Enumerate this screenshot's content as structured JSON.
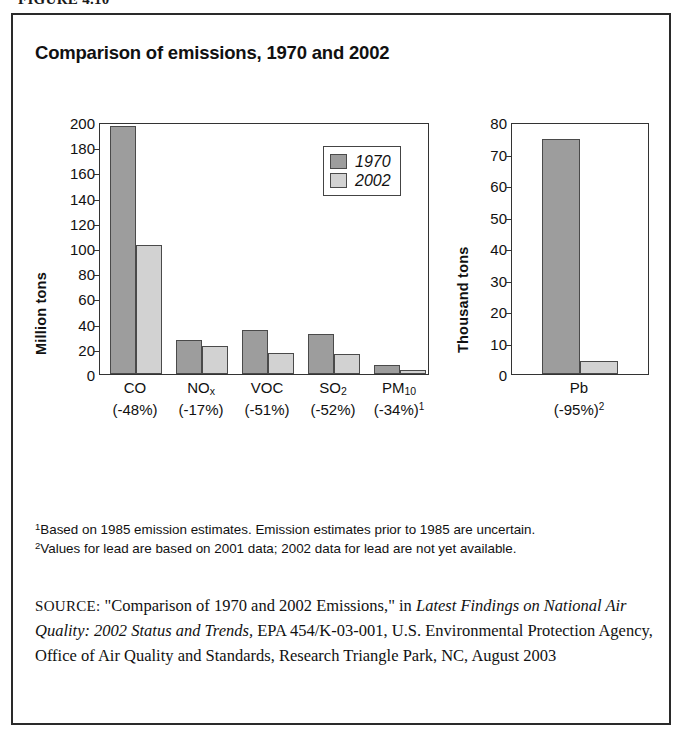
{
  "figure": {
    "number_label": "FIGURE 4.10"
  },
  "chart": {
    "title": "Comparison of emissions, 1970 and 2002"
  },
  "legend": {
    "items": [
      {
        "label": "1970",
        "color": "#9d9d9d",
        "swatch_name": "legend-swatch-1970"
      },
      {
        "label": "2002",
        "color": "#d2d2d2",
        "swatch_name": "legend-swatch-2002"
      }
    ]
  },
  "left_panel": {
    "ylabel": "Million tons",
    "ticks": [
      "0",
      "20",
      "40",
      "60",
      "80",
      "100",
      "120",
      "140",
      "160",
      "180",
      "200"
    ]
  },
  "right_panel": {
    "ylabel": "Thousand tons",
    "ticks": [
      "0",
      "10",
      "20",
      "30",
      "40",
      "50",
      "60",
      "70",
      "80"
    ]
  },
  "categories_left": [
    {
      "name": "CO",
      "sub": "",
      "pct": "(-48%)",
      "note": ""
    },
    {
      "name": "NO",
      "sub": "x",
      "pct": "(-17%)",
      "note": ""
    },
    {
      "name": "VOC",
      "sub": "",
      "pct": "(-51%)",
      "note": ""
    },
    {
      "name": "SO",
      "sub": "2",
      "pct": "(-52%)",
      "note": ""
    },
    {
      "name": "PM",
      "sub": "10",
      "pct": "(-34%)",
      "note": "1"
    }
  ],
  "categories_right": [
    {
      "name": "Pb",
      "sub": "",
      "pct": "(-95%)",
      "note": "2"
    }
  ],
  "footnotes": [
    {
      "marker": "1",
      "text": "Based on 1985 emission estimates. Emission estimates prior to 1985 are uncertain."
    },
    {
      "marker": "2",
      "text": "Values for lead are based on 2001 data; 2002 data for lead are not yet available."
    }
  ],
  "source": {
    "label": "SOURCE:",
    "part1": " \"Comparison of 1970 and 2002 Emissions,\" in ",
    "italic1": "Latest Findings on National Air Quality: 2002 Status and Trends,",
    "part2": " EPA 454/K-03-001, U.S. Environmental Protection Agency, Office of Air Quality and Standards, Research Triangle Park, NC, August 2003"
  },
  "chart_data": [
    {
      "type": "bar",
      "title": "Comparison of emissions, 1970 and 2002 (criteria pollutants)",
      "xlabel": "",
      "ylabel": "Million tons",
      "ylim": [
        0,
        200
      ],
      "yticks": [
        0,
        20,
        40,
        60,
        80,
        100,
        120,
        140,
        160,
        180,
        200
      ],
      "grid": false,
      "legend_position": "top-right",
      "categories": [
        "CO",
        "NOx",
        "VOC",
        "SO2",
        "PM10"
      ],
      "category_annotations": [
        "(-48%)",
        "(-17%)",
        "(-51%)",
        "(-52%)",
        "(-34%)"
      ],
      "series": [
        {
          "name": "1970",
          "color": "#9d9d9d",
          "values": [
            197,
            27,
            35,
            32,
            7
          ]
        },
        {
          "name": "2002",
          "color": "#d2d2d2",
          "values": [
            102,
            22,
            17,
            16,
            3
          ]
        }
      ]
    },
    {
      "type": "bar",
      "title": "Lead emissions, 1970 and 2002",
      "xlabel": "",
      "ylabel": "Thousand tons",
      "ylim": [
        0,
        80
      ],
      "yticks": [
        0,
        10,
        20,
        30,
        40,
        50,
        60,
        70,
        80
      ],
      "grid": false,
      "legend_position": "none",
      "categories": [
        "Pb"
      ],
      "category_annotations": [
        "(-95%)"
      ],
      "series": [
        {
          "name": "1970",
          "color": "#9d9d9d",
          "values": [
            74.5
          ]
        },
        {
          "name": "2002",
          "color": "#d2d2d2",
          "values": [
            4
          ]
        }
      ]
    }
  ]
}
